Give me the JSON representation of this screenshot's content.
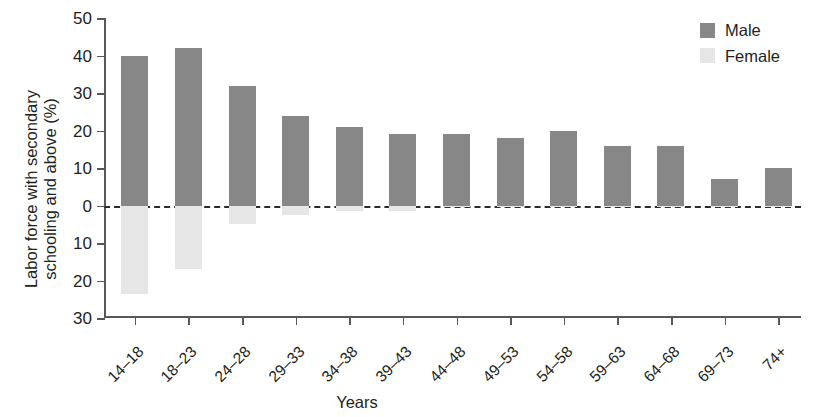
{
  "chart_data": {
    "type": "bar",
    "title": "",
    "xlabel": "Years",
    "ylabel": "Labor force with secondary schooling and above (%)",
    "ylabel_line1": "Labor force with secondary",
    "ylabel_line2": "schooling and above (%)",
    "categories": [
      "14–18",
      "18–23",
      "24–28",
      "29–33",
      "34–38",
      "39–43",
      "44–48",
      "49–53",
      "54–58",
      "59–63",
      "64–68",
      "69–73",
      "74+"
    ],
    "series": [
      {
        "name": "Male",
        "color": "#878787",
        "direction": "up",
        "values": [
          40,
          42,
          32,
          24,
          21,
          19,
          19,
          18,
          20,
          16,
          16,
          7,
          10
        ]
      },
      {
        "name": "Female",
        "color": "#e6e6e6",
        "direction": "down",
        "values": [
          23.5,
          17,
          5,
          2.5,
          1.5,
          1.5,
          0.5,
          0.5,
          0.5,
          0.5,
          0.5,
          0.3,
          0.3
        ]
      }
    ],
    "ylim": [
      -30,
      50
    ],
    "ytick_values": [
      50,
      40,
      30,
      20,
      10,
      0,
      -10,
      -20,
      -30
    ],
    "ytick_labels": [
      "50",
      "40",
      "30",
      "20",
      "10",
      "0",
      "10",
      "20",
      "30"
    ],
    "grid": false,
    "zero_baseline": "dashed",
    "legend_position": "top-right",
    "legend": [
      {
        "label": "Male",
        "color": "#878787"
      },
      {
        "label": "Female",
        "color": "#e6e6e6"
      }
    ]
  }
}
